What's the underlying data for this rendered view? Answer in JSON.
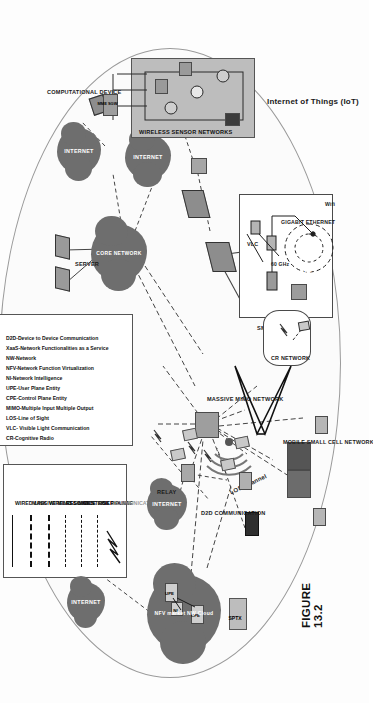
{
  "figure": {
    "caption": "FIGURE 13.2"
  },
  "legend": {
    "items": [
      {
        "label": "WIRED LINK",
        "style": "solid",
        "color": "#111111"
      },
      {
        "label": "MASSIVE MIMO LINKS",
        "style": "dashed-thick",
        "color": "#111111"
      },
      {
        "label": "WIRELESS LINKS",
        "style": "dashed-thick",
        "color": "#111111"
      },
      {
        "label": "RESOURCE LINK",
        "style": "dashed",
        "color": "#111111"
      },
      {
        "label": "CONTROL PLANE",
        "style": "dashed",
        "color": "#111111"
      },
      {
        "label": "USER PLANE",
        "style": "dashed",
        "color": "#111111"
      },
      {
        "label": "COMMUNICATION LINK",
        "style": "lightning",
        "color": "#111111"
      }
    ]
  },
  "abbreviations": [
    "CR-Cognitive Radio",
    "VLC- Visible Light Communication",
    "LOS-Line of Sight",
    "MIMO-Multiple Input Multiple Output",
    "CPE-Control Plane Entity",
    "UPE-User Plane Entity",
    "NI-Network Intelligence",
    "NFV-Network Function Virtualization",
    "NW-Network",
    "XaaS-Network Functionalities as a Service",
    "D2D-Device to Device Communication"
  ],
  "labels": {
    "server": "SERVER",
    "core_network": "CORE NETWORK",
    "computational_device": "COMPUTATIONAL DEVICE",
    "wireless_sensor_networks": "WIRELESS SENSOR NETWORKS",
    "internet_of_things": "Internet of Things (IoT)",
    "relay": "RELAY",
    "d2d_communication": "D2D COMMUNICATION",
    "massive_mimo_network": "MASSIVE MIMO NETWORK",
    "small_cell": "SMALL CELL",
    "mobile_small_cell_network": "MOBILE SMALL CELL NETWORK",
    "cr_network": "CR NETWORK",
    "nfv_cloud": "NFV market NW Cloud",
    "sptx": "SPTX",
    "los_channel": "LOS Channel",
    "vlc": "VLC",
    "sixty_ghz": "60 GHz",
    "gigabit_ethernet": "GIGABIT ETHERNET",
    "wifi": "Wifi",
    "cpe": "CPE",
    "upe": "UPE",
    "ni": "NI",
    "mme_sgw": "MME SGW"
  },
  "clouds": [
    {
      "name": "internet-cloud-1",
      "label": "INTERNET"
    },
    {
      "name": "internet-cloud-2",
      "label": "INTERNET"
    },
    {
      "name": "internet-cloud-3",
      "label": "INTERNET"
    },
    {
      "name": "internet-cloud-4",
      "label": "INTERNET"
    },
    {
      "name": "internet-cloud-5",
      "label": "INTERNET"
    },
    {
      "name": "core-network-cloud",
      "label": "CORE NETWORK"
    },
    {
      "name": "nfv-cloud",
      "label": "NFV market NW Cloud"
    }
  ],
  "colors": {
    "cloud_fill": "#6e6e6e",
    "panel_fill": "#bdbdbd",
    "line": "#333333",
    "background": "#fdfdfd"
  }
}
